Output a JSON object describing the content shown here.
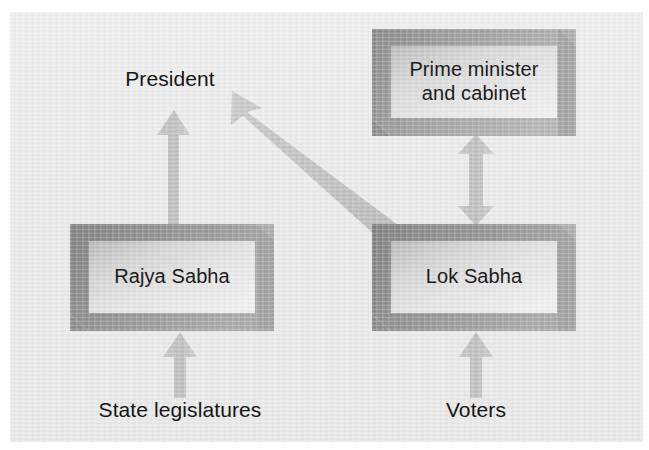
{
  "figure": {
    "kind": "government-structure-flowchart",
    "background_color": "#eaeaea",
    "page_color": "#ffffff",
    "text_color": "#1b1b1b",
    "arrow_color": "#b8b8b8",
    "box_frame_color": "#8f8f8f",
    "box_panel_color": "#d8d8d8",
    "clipped_title_fragment": "g"
  },
  "nodes": {
    "president": {
      "label": "President",
      "type": "plain-text-label"
    },
    "prime_minister": {
      "label": "Prime minister\nand cabinet",
      "type": "beveled-box"
    },
    "rajya_sabha": {
      "label": "Rajya Sabha",
      "type": "beveled-box"
    },
    "lok_sabha": {
      "label": "Lok Sabha",
      "type": "beveled-box"
    },
    "state_legislatures": {
      "label": "State legislatures",
      "type": "plain-text-label"
    },
    "voters": {
      "label": "Voters",
      "type": "plain-text-label"
    }
  },
  "edges": [
    {
      "id": "state-legislatures-to-rajya-sabha",
      "from": "State legislatures",
      "to": "Rajya Sabha",
      "style": "single-headed-arrow",
      "direction": "up"
    },
    {
      "id": "voters-to-lok-sabha",
      "from": "Voters",
      "to": "Lok Sabha",
      "style": "single-headed-arrow",
      "direction": "up"
    },
    {
      "id": "rajya-sabha-to-president",
      "from": "Rajya Sabha",
      "to": "President",
      "style": "single-headed-arrow",
      "direction": "up"
    },
    {
      "id": "lok-sabha-to-president",
      "from": "Lok Sabha",
      "to": "President",
      "style": "single-headed-arrow",
      "direction": "diagonal-up-left"
    },
    {
      "id": "lok-sabha-and-prime-minister",
      "from": "Lok Sabha",
      "to": "Prime minister and cabinet",
      "style": "double-headed-arrow",
      "direction": "vertical-both"
    }
  ]
}
